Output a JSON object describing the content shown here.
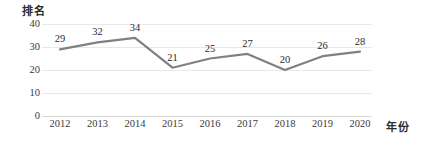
{
  "chart_data": {
    "type": "line",
    "title": "",
    "subtitle": "",
    "xlabel": "年份",
    "ylabel": "排名",
    "categories": [
      "2012",
      "2013",
      "2014",
      "2015",
      "2016",
      "2017",
      "2018",
      "2019",
      "2020"
    ],
    "values": [
      29,
      32,
      34,
      21,
      25,
      27,
      20,
      26,
      28
    ],
    "series": [
      {
        "name": "排名",
        "values": [
          29,
          32,
          34,
          21,
          25,
          27,
          20,
          26,
          28
        ]
      }
    ],
    "data_labels": [
      "29",
      "32",
      "34",
      "21",
      "25",
      "27",
      "20",
      "26",
      "28"
    ],
    "ylim": [
      0,
      40
    ],
    "y_ticks": [
      40,
      30,
      20,
      10,
      0
    ],
    "y_tick_labels": [
      "40",
      "30",
      "20",
      "10",
      "0"
    ],
    "grid": true,
    "grid_axis": "y",
    "legend": false,
    "legend_position": "none",
    "markers": false,
    "colors": {
      "line": "#808080",
      "gridline": "#e8e8e8",
      "baseline": "#d8d8d8",
      "text": "#2b2b2b",
      "tick_text": "#3a3a3a",
      "background": "#ffffff"
    }
  }
}
